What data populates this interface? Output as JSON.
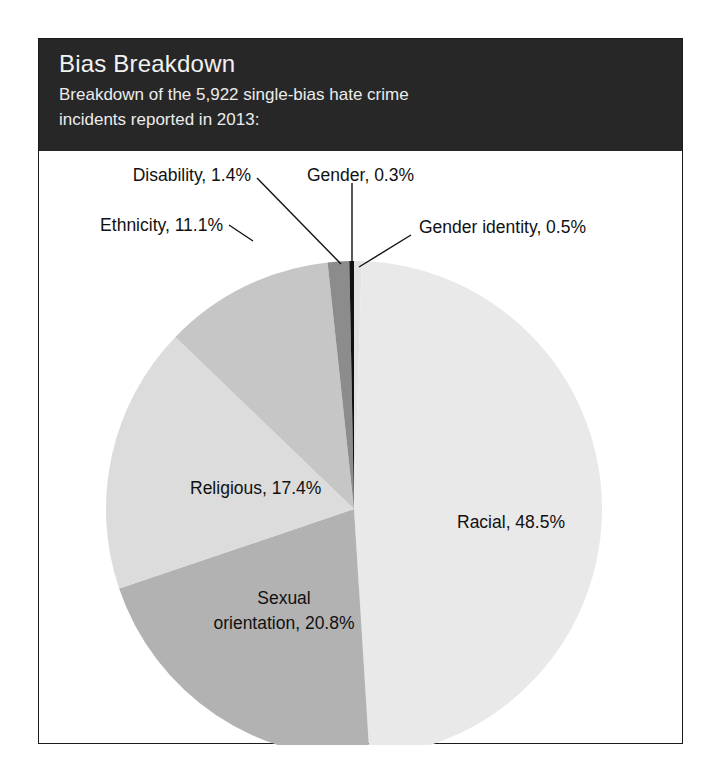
{
  "card": {
    "title": "Bias Breakdown",
    "subtitle_line1": "Breakdown of the 5,922 single-bias hate crime",
    "subtitle_line2": "incidents reported in 2013:",
    "header_bg": "#272727",
    "header_text_color": "#f2f2f2",
    "border_color": "#1a1a1a",
    "background": "#ffffff"
  },
  "chart_data": {
    "type": "pie",
    "title": "Bias Breakdown",
    "subtitle": "Breakdown of the 5,922 single-bias hate crime incidents reported in 2013:",
    "total_incidents": "5,922",
    "year": "2013",
    "unit": "percent",
    "legend": "none (labels placed on/around slices)",
    "grid": false,
    "start_angle_deg": 0,
    "direction": "clockwise",
    "categories": [
      "Gender identity",
      "Racial",
      "Sexual orientation",
      "Religious",
      "Ethnicity",
      "Disability",
      "Gender"
    ],
    "values": [
      0.5,
      48.5,
      20.8,
      17.4,
      11.1,
      1.4,
      0.3
    ],
    "slices": [
      {
        "label": "Gender identity",
        "value": 0.5,
        "display": "Gender identity, 0.5%",
        "color": "#e2e2e2",
        "label_placement": "outside"
      },
      {
        "label": "Racial",
        "value": 48.5,
        "display": "Racial, 48.5%",
        "color": "#e9e9e9",
        "label_placement": "inside"
      },
      {
        "label": "Sexual orientation",
        "value": 20.8,
        "display": "Sexual orientation, 20.8%",
        "display_line1": "Sexual",
        "display_line2": "orientation, 20.8%",
        "color": "#b2b2b2",
        "label_placement": "inside"
      },
      {
        "label": "Religious",
        "value": 17.4,
        "display": "Religious, 17.4%",
        "color": "#dcdcdc",
        "label_placement": "inside"
      },
      {
        "label": "Ethnicity",
        "value": 11.1,
        "display": "Ethnicity, 11.1%",
        "color": "#c6c6c6",
        "label_placement": "outside"
      },
      {
        "label": "Disability",
        "value": 1.4,
        "display": "Disability, 1.4%",
        "color": "#8c8c8c",
        "label_placement": "outside"
      },
      {
        "label": "Gender",
        "value": 0.3,
        "display": "Gender, 0.3%",
        "color": "#111111",
        "label_placement": "outside"
      }
    ]
  }
}
